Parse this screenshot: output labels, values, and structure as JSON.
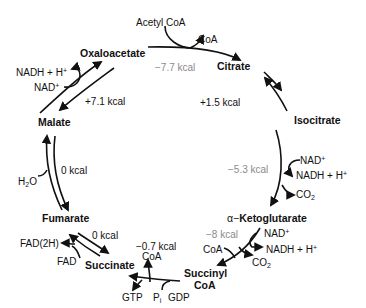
{
  "diagram": {
    "metabolites": {
      "oxaloacetate": "Oxaloacetate",
      "citrate": "Citrate",
      "isocitrate": "Isocitrate",
      "ketoglutarate_prefix": "α−",
      "ketoglutarate": "Ketoglutarate",
      "succinyl_coa_line1": "Succinyl",
      "succinyl_coa_line2": "CoA",
      "succinate": "Succinate",
      "fumarate": "Fumarate",
      "malate": "Malate"
    },
    "energies": {
      "citrate_synthase": "−7.7 kcal",
      "aconitase": "+1.5 kcal",
      "isocitrate_dh": "−5.3 kcal",
      "ketoglutarate_dh": "−8 kcal",
      "succinyl_coa_synthetase": "−0.7 kcal",
      "succinate_dh": "0 kcal",
      "fumarase": "0 kcal",
      "malate_dh": "+7.1 kcal"
    },
    "cofactors": {
      "acetyl_coa": "Acetyl CoA",
      "coa_top": "CoA",
      "isocitrate_nad": "NAD",
      "isocitrate_nadh": "NADH + H",
      "isocitrate_co2": "CO",
      "akg_nad": "NAD",
      "akg_nadh": "NADH + H",
      "akg_co2": "CO",
      "akg_coa": "CoA",
      "succ_coa": "CoA",
      "succ_gtp": "GTP",
      "succ_pi": "P",
      "succ_pi_sub": "i",
      "succ_gdp": "GDP",
      "fad2h": "FAD(2H)",
      "fad": "FAD",
      "h2o": "H",
      "h2o_sub": "2",
      "h2o_tail": "O",
      "malate_nadh": "NADH + H",
      "malate_nad": "NAD",
      "plus_sup": "+",
      "co2_sub": "2"
    },
    "colors": {
      "ink": "#111111",
      "gray_energy": "#8a8a8a"
    }
  }
}
